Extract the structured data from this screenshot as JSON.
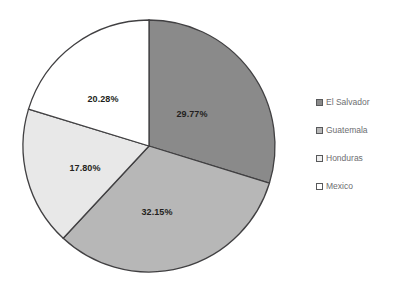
{
  "chart_data": {
    "type": "pie",
    "title": "",
    "subtitle": "",
    "xlabel": "",
    "ylabel": "",
    "grid": false,
    "legend_position": "right",
    "start_angle_deg": 0,
    "direction": "clockwise",
    "categories": [
      "El Salvador",
      "Guatemala",
      "Honduras",
      "Mexico"
    ],
    "values": [
      29.77,
      32.15,
      17.8,
      20.28
    ],
    "total": 100.0,
    "slices": [
      {
        "label": "El Salvador",
        "value": 29.77,
        "data_label": "29.77%",
        "color": "#8a8a8a",
        "stroke": "#414042",
        "label_x": 192,
        "label_y": 114
      },
      {
        "label": "Guatemala",
        "value": 32.15,
        "data_label": "32.15%",
        "color": "#b7b7b7",
        "stroke": "#414042",
        "label_x": 157,
        "label_y": 212
      },
      {
        "label": "Honduras",
        "value": 17.8,
        "data_label": "17.80%",
        "color": "#e8e8e8",
        "stroke": "#414042",
        "label_x": 85,
        "label_y": 168
      },
      {
        "label": "Mexico",
        "value": 20.28,
        "data_label": "20.28%",
        "color": "#ffffff",
        "stroke": "#414042",
        "label_x": 103,
        "label_y": 99
      }
    ]
  },
  "legend": {
    "items": [
      {
        "label": "El Salvador",
        "color": "#8a8a8a"
      },
      {
        "label": "Guatemala",
        "color": "#b7b7b7"
      },
      {
        "label": "Honduras",
        "color": "#eeeeee"
      },
      {
        "label": "Mexico",
        "color": "#ffffff"
      }
    ]
  },
  "geometry": {
    "center_x": 149,
    "center_y": 146,
    "radius": 126
  }
}
